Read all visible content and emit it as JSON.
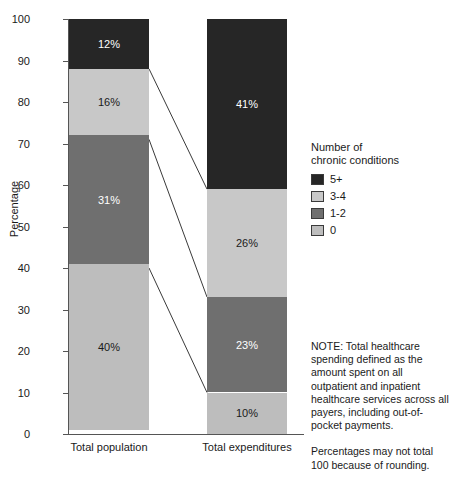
{
  "chart_data": {
    "type": "bar",
    "subtype": "stacked-100-percent",
    "title": "",
    "xlabel": "",
    "ylabel": "Percentage",
    "ylim": [
      0,
      100
    ],
    "yticks": [
      0,
      10,
      20,
      30,
      40,
      50,
      60,
      70,
      80,
      90,
      100
    ],
    "grid": false,
    "legend_position": "right",
    "legend_title_lines": [
      "Number of",
      "chronic conditions"
    ],
    "categories": [
      "Total population",
      "Total expenditures"
    ],
    "series": [
      {
        "name": "5+",
        "color": "#262626",
        "values": [
          12,
          41
        ],
        "labels": [
          "12%",
          "41%"
        ],
        "label_color": "light"
      },
      {
        "name": "3-4",
        "color": "#c8c8c8",
        "values": [
          16,
          26
        ],
        "labels": [
          "16%",
          "26%"
        ],
        "label_color": "dark"
      },
      {
        "name": "1-2",
        "color": "#6f6f6f",
        "values": [
          31,
          23
        ],
        "labels": [
          "31%",
          "23%"
        ],
        "label_color": "light"
      },
      {
        "name": "0",
        "color": "#bdbdbd",
        "values": [
          40,
          10
        ],
        "labels": [
          "40%",
          "10%"
        ],
        "label_color": "dark"
      }
    ],
    "connectors": [
      {
        "from_value": 88,
        "to_value": 59
      },
      {
        "from_value": 71,
        "to_value": 33
      },
      {
        "from_value": 40,
        "to_value": 10
      }
    ]
  },
  "legend": {
    "title_line1": "Number of",
    "title_line2": "chronic conditions",
    "items": [
      {
        "label": "5+",
        "color": "#262626"
      },
      {
        "label": "3-4",
        "color": "#c8c8c8"
      },
      {
        "label": "1-2",
        "color": "#6f6f6f"
      },
      {
        "label": "0",
        "color": "#bdbdbd"
      }
    ]
  },
  "axes": {
    "y_title": "Percentage",
    "y_tick_labels": [
      "100",
      "90",
      "80",
      "70",
      "60",
      "50",
      "40",
      "30",
      "20",
      "10",
      "0"
    ],
    "x_tick_labels": [
      "Total population",
      "Total expenditures"
    ]
  },
  "notes": {
    "note_text": "NOTE: Total healthcare spending defined as the amount spent on all outpatient and inpatient healthcare services across all payers, including out-of-pocket payments.",
    "rounding_text": "Percentages may not total 100 because of rounding."
  }
}
